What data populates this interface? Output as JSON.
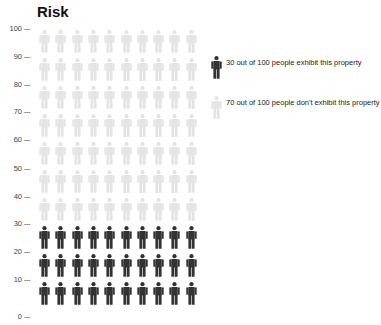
{
  "chart_data": {
    "type": "pictogram",
    "title": "Risk",
    "xlabel": "",
    "ylabel": "",
    "ylim": [
      0,
      100
    ],
    "y_ticks": [
      100,
      90,
      80,
      70,
      60,
      50,
      40,
      30,
      20,
      10,
      0
    ],
    "grid": false,
    "total": 100,
    "rows": 10,
    "columns": 10,
    "series": [
      {
        "name": "30 out of 100 people exhibit this property",
        "value": 30,
        "color": "#333333"
      },
      {
        "name": "70 out of 100 people don't exhibit this property",
        "value": 70,
        "color": "#e4e4e4"
      }
    ],
    "legend_position": "right"
  },
  "title": "Risk",
  "ticks": [
    {
      "label": "100",
      "y": 24
    },
    {
      "label": "90",
      "y": 52
    },
    {
      "label": "80",
      "y": 80
    },
    {
      "label": "70",
      "y": 107
    },
    {
      "label": "60",
      "y": 135
    },
    {
      "label": "50",
      "y": 164
    },
    {
      "label": "40",
      "y": 192
    },
    {
      "label": "30",
      "y": 219
    },
    {
      "label": "20",
      "y": 247
    },
    {
      "label": "10",
      "y": 275
    },
    {
      "label": "0",
      "y": 312
    }
  ],
  "tick_dash": "---",
  "legend": [
    {
      "text": "30 out of 100 people exhibit this property",
      "color": "#333333"
    },
    {
      "text": "70 out of 100 people don't exhibit this property",
      "color": "#e4e4e4"
    }
  ],
  "colors": {
    "exhibit": "#333333",
    "not_exhibit": "#e4e4e4"
  }
}
